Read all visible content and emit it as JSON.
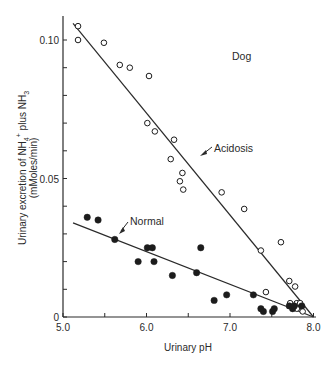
{
  "chart_data": {
    "type": "scatter",
    "title": "",
    "panel_label": "Dog",
    "xlabel": "Urinary pH",
    "ylabel": "Urinary excretion of NH4+ plus NH3",
    "ylabel_line1_parts": {
      "a": "Urinary excretion of NH",
      "sub4": "4",
      "sup": "+",
      "b": " plus NH",
      "sub3": "3"
    },
    "ylabel_units": "(mMoles/min)",
    "xlim": [
      5.0,
      8.0
    ],
    "ylim": [
      0,
      0.11
    ],
    "x_ticks": [
      5.0,
      5.5,
      6.0,
      6.5,
      7.0,
      7.5,
      8.0
    ],
    "x_tick_labels": [
      "5.0",
      "",
      "6.0",
      "",
      "7.0",
      "",
      "8.0"
    ],
    "y_ticks": [
      0,
      0.01,
      0.02,
      0.03,
      0.04,
      0.05,
      0.06,
      0.07,
      0.08,
      0.09,
      0.1
    ],
    "y_tick_labels": [
      "0",
      "",
      "",
      "",
      "",
      "0.05",
      "",
      "",
      "",
      "",
      "0.10"
    ],
    "grid": false,
    "legend": "none",
    "series": [
      {
        "name": "Acidosis",
        "marker": "open-circle",
        "annotation": "Acidosis",
        "fit_line": {
          "x": [
            5.12,
            8.0
          ],
          "y": [
            0.106,
            0.0
          ]
        },
        "points": [
          [
            5.18,
            0.105
          ],
          [
            5.18,
            0.1
          ],
          [
            5.49,
            0.099
          ],
          [
            5.68,
            0.091
          ],
          [
            5.8,
            0.09
          ],
          [
            6.03,
            0.087
          ],
          [
            6.01,
            0.07
          ],
          [
            6.1,
            0.067
          ],
          [
            6.33,
            0.064
          ],
          [
            6.29,
            0.057
          ],
          [
            6.43,
            0.052
          ],
          [
            6.4,
            0.049
          ],
          [
            6.44,
            0.046
          ],
          [
            6.9,
            0.045
          ],
          [
            7.17,
            0.039
          ],
          [
            7.61,
            0.027
          ],
          [
            7.37,
            0.024
          ],
          [
            7.71,
            0.013
          ],
          [
            7.78,
            0.011
          ],
          [
            7.43,
            0.009
          ],
          [
            7.72,
            0.005
          ],
          [
            7.8,
            0.005
          ],
          [
            7.84,
            0.005
          ],
          [
            7.8,
            0.003
          ],
          [
            7.87,
            0.002
          ]
        ]
      },
      {
        "name": "Normal",
        "marker": "filled-circle",
        "annotation": "Normal",
        "fit_line": {
          "x": [
            5.12,
            8.0
          ],
          "y": [
            0.034,
            0.0
          ]
        },
        "points": [
          [
            5.29,
            0.036
          ],
          [
            5.42,
            0.035
          ],
          [
            5.62,
            0.028
          ],
          [
            5.9,
            0.02
          ],
          [
            6.01,
            0.025
          ],
          [
            6.07,
            0.025
          ],
          [
            6.09,
            0.02
          ],
          [
            6.31,
            0.015
          ],
          [
            6.6,
            0.016
          ],
          [
            6.65,
            0.025
          ],
          [
            6.81,
            0.006
          ],
          [
            6.96,
            0.008
          ],
          [
            7.28,
            0.008
          ],
          [
            7.37,
            0.003
          ],
          [
            7.4,
            0.002
          ],
          [
            7.51,
            0.002
          ],
          [
            7.53,
            0.003
          ],
          [
            7.71,
            0.004
          ],
          [
            7.75,
            0.003
          ],
          [
            7.77,
            0.004
          ],
          [
            7.86,
            0.004
          ]
        ]
      }
    ]
  }
}
